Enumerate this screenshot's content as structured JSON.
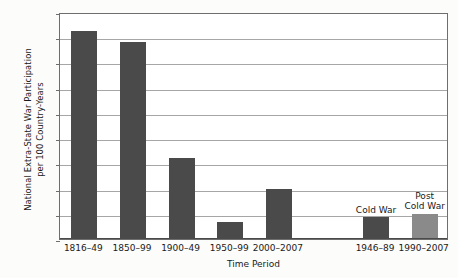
{
  "chart_data": {
    "type": "bar",
    "title": "",
    "xlabel": "Time Period",
    "ylabel_lines": [
      "National Extra-State War Participation",
      "per 100 Country-Years"
    ],
    "ylabel": "National Extra-State War Participation per 100 Country-Years",
    "ylim": [
      0,
      4.5
    ],
    "ytick_labels": [
      "4.5",
      "4",
      "3.5",
      "3",
      "2.5",
      "2",
      "1.5",
      "1",
      "0.5",
      "0"
    ],
    "ytick_values": [
      4.5,
      4,
      3.5,
      3,
      2.5,
      2,
      1.5,
      1,
      0.5,
      0
    ],
    "grid": "horizontal",
    "legend": "none",
    "categories": [
      "1816–49",
      "1850–99",
      "1900–49",
      "1950–99",
      "2000–2007",
      "",
      "1946–89",
      "1990–2007"
    ],
    "values": [
      4.12,
      3.91,
      1.6,
      0.33,
      1.0,
      null,
      0.43,
      0.5
    ],
    "bar_colors": [
      "#4a4a4a",
      "#4a4a4a",
      "#4a4a4a",
      "#4a4a4a",
      "#4a4a4a",
      null,
      "#4a4a4a",
      "#8a8a8a"
    ],
    "annotations": [
      {
        "text": "Cold War",
        "category": "1946–89"
      },
      {
        "text": "Post Cold War",
        "lines": [
          "Post",
          "Cold War"
        ],
        "category": "1990–2007"
      }
    ],
    "colors": {
      "bar_dark": "#4a4a4a",
      "bar_light": "#8a8a8a",
      "grid": "#a6a6a6",
      "axis": "#6e6e6e",
      "background": "#fcfcfa",
      "plot_background": "#ffffff"
    }
  },
  "ticks": {
    "y": [
      {
        "label": "4.5"
      },
      {
        "label": "4"
      },
      {
        "label": "3.5"
      },
      {
        "label": "3"
      },
      {
        "label": "2.5"
      },
      {
        "label": "2"
      },
      {
        "label": "1.5"
      },
      {
        "label": "1"
      },
      {
        "label": "0.5"
      },
      {
        "label": "0"
      }
    ],
    "x": [
      {
        "label": "1816–49"
      },
      {
        "label": "1850–99"
      },
      {
        "label": "1900–49"
      },
      {
        "label": "1950–99"
      },
      {
        "label": "2000–2007"
      },
      {
        "label": "1946–89"
      },
      {
        "label": "1990–2007"
      }
    ]
  },
  "annotations": {
    "cold_war": "Cold War",
    "post_line1": "Post",
    "post_line2": "Cold War"
  },
  "axis_titles": {
    "x": "Time Period",
    "y_line1": "National Extra-State War Participation",
    "y_line2": "per 100 Country-Years"
  }
}
